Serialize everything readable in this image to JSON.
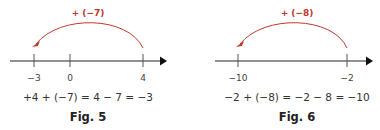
{
  "colors": {
    "axis": "#222222",
    "tick": "#555555",
    "arc": "#c0392b",
    "text": "#333333"
  },
  "figures": [
    {
      "caption": "Fig. 5",
      "jump_label": "+ (−7)",
      "equation": "+4 + (−7) = 4 − 7 = −3",
      "start": 4,
      "jump": -7,
      "end": -3,
      "ticks": [
        {
          "value": -3,
          "label": "−3"
        },
        {
          "value": 0,
          "label": "0"
        },
        {
          "value": 4,
          "label": "4"
        }
      ]
    },
    {
      "caption": "Fig. 6",
      "jump_label": "+ (−8)",
      "equation": "−2 + (−8) = −2 − 8 = −10",
      "start": -2,
      "jump": -8,
      "end": -10,
      "ticks": [
        {
          "value": -10,
          "label": "−10"
        },
        {
          "value": -2,
          "label": "−2"
        }
      ]
    }
  ]
}
